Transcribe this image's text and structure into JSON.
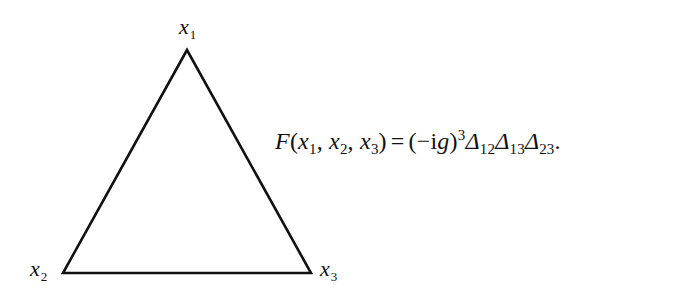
{
  "diagram": {
    "type": "triangle",
    "stroke_color": "#111111",
    "vertices": [
      {
        "id": "x1",
        "label": "x",
        "sub": "1",
        "position": "top"
      },
      {
        "id": "x2",
        "label": "x",
        "sub": "2",
        "position": "bottom-left"
      },
      {
        "id": "x3",
        "label": "x",
        "sub": "3",
        "position": "bottom-right"
      }
    ]
  },
  "formula": {
    "lhs": {
      "func": "F",
      "open": "(",
      "args": [
        {
          "var": "x",
          "sub": "1"
        },
        {
          "var": "x",
          "sub": "2"
        },
        {
          "var": "x",
          "sub": "3"
        }
      ],
      "sep": ",",
      "close": ")"
    },
    "equals": "=",
    "rhs": {
      "factor_open": "(",
      "minus": "−",
      "i": "i",
      "g": "g",
      "factor_close": ")",
      "power": "3",
      "propagators": [
        {
          "symbol": "Δ",
          "sub": "12"
        },
        {
          "symbol": "Δ",
          "sub": "13"
        },
        {
          "symbol": "Δ",
          "sub": "23"
        }
      ],
      "terminator": "."
    },
    "full_text": "F(x1, x2, x3) = (−ig)^3 Δ12 Δ13 Δ23."
  }
}
